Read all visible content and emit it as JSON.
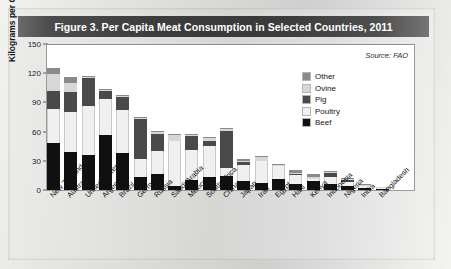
{
  "figure": {
    "title": "Figure 3. Per Capita Meat Consumption in Selected Countries, 2011",
    "source": "Source: FAO"
  },
  "axes": {
    "ylabel": "Kilograms per Capita",
    "yticks": [
      "0",
      "30",
      "60",
      "90",
      "120",
      "150"
    ]
  },
  "legend": {
    "items": [
      {
        "label": "Other",
        "key": "other",
        "color": "#8a8a8a"
      },
      {
        "label": "Ovine",
        "key": "ovine",
        "color": "#d7d7d6"
      },
      {
        "label": "Pig",
        "key": "pig",
        "color": "#4a4a4a"
      },
      {
        "label": "Poultry",
        "key": "poultry",
        "color": "#f1f1f0"
      },
      {
        "label": "Beef",
        "key": "beef",
        "color": "#101010"
      }
    ]
  },
  "chart_data": {
    "type": "bar",
    "stacked": true,
    "title": "Figure 3. Per Capita Meat Consumption in Selected Countries, 2011",
    "xlabel": "",
    "ylabel": "Kilograms per Capita",
    "ylim": [
      0,
      150
    ],
    "yticks": [
      0,
      30,
      60,
      90,
      120,
      150
    ],
    "grid": false,
    "legend_position": "inside-upper-right",
    "annotations": [
      "Source: FAO"
    ],
    "categories": [
      "New Zealand",
      "Australia",
      "United States",
      "Argentina",
      "Brazil",
      "Germany",
      "Russia",
      "Saudi Arabia",
      "Mexico",
      "South Africa",
      "China",
      "Japan",
      "Iran",
      "Egypt",
      "Haiti",
      "Kenya",
      "Indonesia",
      "Nigeria",
      "India",
      "Bangladesh"
    ],
    "series": [
      {
        "name": "Beef",
        "values": [
          48,
          39,
          36,
          57,
          38,
          13,
          16,
          4,
          10,
          13,
          14,
          9,
          7,
          11,
          6,
          9,
          6,
          4,
          2,
          1
        ]
      },
      {
        "name": "Poultry",
        "values": [
          35,
          41,
          50,
          37,
          44,
          19,
          24,
          46,
          31,
          32,
          9,
          17,
          23,
          14,
          9,
          2,
          7,
          4,
          2,
          1
        ]
      },
      {
        "name": "Pig",
        "values": [
          19,
          21,
          29,
          8,
          14,
          41,
          18,
          0,
          15,
          5,
          38,
          3,
          0,
          0,
          1,
          0,
          5,
          2,
          0,
          0
        ]
      },
      {
        "name": "Ovine",
        "values": [
          17,
          9,
          1,
          1,
          1,
          1,
          2,
          7,
          1,
          3,
          2,
          1,
          4,
          1,
          1,
          2,
          1,
          1,
          1,
          1
        ]
      },
      {
        "name": "Other",
        "values": [
          6,
          6,
          1,
          1,
          1,
          1,
          1,
          1,
          1,
          1,
          1,
          2,
          1,
          1,
          4,
          3,
          1,
          1,
          1,
          0
        ]
      }
    ],
    "totals": [
      125,
      116,
      117,
      104,
      98,
      75,
      61,
      58,
      58,
      54,
      64,
      32,
      35,
      27,
      21,
      16,
      20,
      12,
      6,
      3
    ]
  }
}
